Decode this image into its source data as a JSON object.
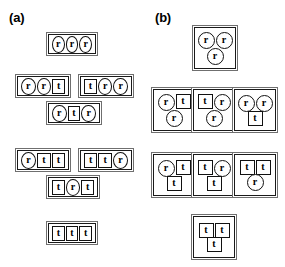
{
  "figure": {
    "panels": [
      {
        "label": "(a)",
        "key": "a",
        "layout": "linear",
        "groups": [
          {
            "row": 0,
            "x": 46,
            "y": 32,
            "width": 52,
            "tokens": [
              "r",
              "r",
              "r"
            ]
          },
          {
            "row": 1,
            "x": 15,
            "y": 74,
            "width": 56,
            "tokens": [
              "r",
              "r",
              "t"
            ]
          },
          {
            "row": 1,
            "x": 78,
            "y": 74,
            "width": 56,
            "tokens": [
              "t",
              "r",
              "r"
            ]
          },
          {
            "row": 2,
            "x": 46,
            "y": 101,
            "width": 56,
            "tokens": [
              "r",
              "t",
              "r"
            ]
          },
          {
            "row": 3,
            "x": 15,
            "y": 148,
            "width": 56,
            "tokens": [
              "r",
              "t",
              "t"
            ]
          },
          {
            "row": 3,
            "x": 78,
            "y": 148,
            "width": 56,
            "tokens": [
              "t",
              "t",
              "r"
            ]
          },
          {
            "row": 4,
            "x": 46,
            "y": 175,
            "width": 54,
            "tokens": [
              "t",
              "r",
              "t"
            ]
          },
          {
            "row": 5,
            "x": 46,
            "y": 221,
            "width": 52,
            "tokens": [
              "t",
              "t",
              "t"
            ]
          }
        ]
      },
      {
        "label": "(b)",
        "key": "b",
        "layout": "triangle",
        "groups": [
          {
            "row": 0,
            "x": 49,
            "y": 25,
            "top": [
              "r",
              "r"
            ],
            "bottom": [
              "r"
            ]
          },
          {
            "row": 1,
            "x": 8,
            "y": 87,
            "top": [
              "r",
              "t"
            ],
            "bottom": [
              "r"
            ]
          },
          {
            "row": 1,
            "x": 48,
            "y": 87,
            "top": [
              "t",
              "r"
            ],
            "bottom": [
              "r"
            ]
          },
          {
            "row": 1,
            "x": 89,
            "y": 87,
            "top": [
              "r",
              "r"
            ],
            "bottom": [
              "t"
            ]
          },
          {
            "row": 2,
            "x": 8,
            "y": 152,
            "top": [
              "r",
              "t"
            ],
            "bottom": [
              "t"
            ]
          },
          {
            "row": 2,
            "x": 48,
            "y": 152,
            "top": [
              "t",
              "r"
            ],
            "bottom": [
              "t"
            ]
          },
          {
            "row": 2,
            "x": 89,
            "y": 152,
            "top": [
              "t",
              "t"
            ],
            "bottom": [
              "r"
            ]
          },
          {
            "row": 3,
            "x": 48,
            "y": 214,
            "top": [
              "t",
              "t"
            ],
            "bottom": [
              "t"
            ]
          }
        ]
      }
    ],
    "token_glyphs": {
      "r": "r",
      "t": "t"
    },
    "token_shapes": {
      "r": "circle",
      "t": "square"
    },
    "colors": {
      "background": "#ffffff",
      "token_outline": "#111111",
      "group_outer_border": "#6f6f6f",
      "group_inner_border": "#1a1a1a",
      "text": "#000000"
    }
  }
}
